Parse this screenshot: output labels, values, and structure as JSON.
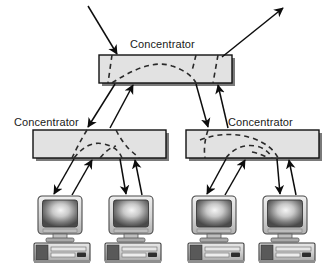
{
  "diagram": {
    "canvas": {
      "width": 333,
      "height": 269,
      "background": "#ffffff"
    },
    "colors": {
      "box_fill": "#e2e2e2",
      "box_stroke": "#111111",
      "box_shadow": "#7a7a7a",
      "line": "#0d0d0d",
      "dashed_line": "#2a2a2a",
      "label_text": "#1a1a1a",
      "monitor_bezel": "#d8d8d8",
      "monitor_screen_dark": "#3f3f3f",
      "monitor_screen_light": "#f2f2f2",
      "case_dark": "#4a4a4a",
      "case_light": "#c9c9c9"
    },
    "concentrators": [
      {
        "id": "top-concentrator",
        "label": "Concentrator",
        "label_x": 130,
        "label_y": 48,
        "box": {
          "x": 99,
          "y": 55,
          "w": 133,
          "h": 28
        }
      },
      {
        "id": "left-concentrator",
        "label": "Concentrator",
        "label_x": 14,
        "label_y": 126,
        "box": {
          "x": 33,
          "y": 130,
          "w": 133,
          "h": 28
        }
      },
      {
        "id": "right-concentrator",
        "label": "Concentrator",
        "label_x": 228,
        "label_y": 126,
        "box": {
          "x": 186,
          "y": 130,
          "w": 133,
          "h": 28
        }
      }
    ],
    "workstations": [
      {
        "id": "workstation-1",
        "x": 34,
        "y": 196
      },
      {
        "id": "workstation-2",
        "x": 105,
        "y": 196
      },
      {
        "id": "workstation-3",
        "x": 188,
        "y": 196
      },
      {
        "id": "workstation-4",
        "x": 259,
        "y": 196
      }
    ],
    "external_links": [
      {
        "id": "uplink-in",
        "direction": "inbound",
        "from": [
          88,
          6
        ],
        "to": [
          117,
          54
        ]
      },
      {
        "id": "uplink-out",
        "direction": "outbound",
        "from": [
          222,
          57
        ],
        "to": [
          283,
          8
        ]
      }
    ],
    "trunk_links": [
      {
        "id": "top-to-left-down",
        "from": [
          115,
          84
        ],
        "to": [
          88,
          127
        ]
      },
      {
        "id": "left-to-top-up",
        "from": [
          110,
          128
        ],
        "to": [
          133,
          85
        ]
      },
      {
        "id": "top-to-right-down",
        "from": [
          196,
          84
        ],
        "to": [
          208,
          127
        ]
      },
      {
        "id": "right-to-top-up",
        "from": [
          228,
          128
        ],
        "to": [
          218,
          85
        ]
      }
    ],
    "access_links": [
      {
        "id": "left-to-ws1-down",
        "from": [
          74,
          159
        ],
        "to": [
          54,
          194
        ]
      },
      {
        "id": "ws1-to-left-up",
        "from": [
          72,
          195
        ],
        "to": [
          92,
          160
        ]
      },
      {
        "id": "left-to-ws2-down",
        "from": [
          120,
          159
        ],
        "to": [
          126,
          194
        ]
      },
      {
        "id": "ws2-to-left-up",
        "from": [
          142,
          195
        ],
        "to": [
          135,
          160
        ]
      },
      {
        "id": "right-to-ws3-down",
        "from": [
          226,
          159
        ],
        "to": [
          207,
          194
        ]
      },
      {
        "id": "ws3-to-right-up",
        "from": [
          225,
          195
        ],
        "to": [
          245,
          160
        ]
      },
      {
        "id": "right-to-ws4-down",
        "from": [
          277,
          159
        ],
        "to": [
          280,
          194
        ]
      },
      {
        "id": "ws4-to-right-up",
        "from": [
          296,
          195
        ],
        "to": [
          289,
          160
        ]
      }
    ]
  }
}
